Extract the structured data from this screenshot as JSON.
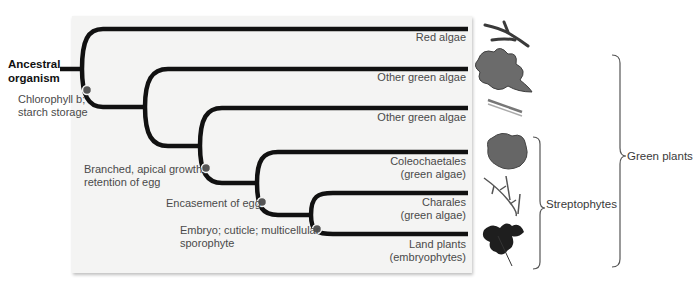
{
  "diagram": {
    "type": "phylogenetic-tree",
    "root_label": [
      "Ancestral",
      "organism"
    ],
    "taxa": [
      {
        "label": [
          "Red algae"
        ],
        "icon": "red-alga-icon"
      },
      {
        "label": [
          "Other green algae"
        ],
        "icon": "green-alga-thallus-icon"
      },
      {
        "label": [
          "Other green algae"
        ],
        "icon": "filamentous-alga-icon"
      },
      {
        "label": [
          "Coleochaetales",
          "(green algae)"
        ],
        "icon": "coleochaete-disk-icon"
      },
      {
        "label": [
          "Charales",
          "(green algae)"
        ],
        "icon": "chara-stonewort-icon"
      },
      {
        "label": [
          "Land plants",
          "(embryophytes)"
        ],
        "icon": "fern-frond-icon"
      }
    ],
    "synapomorphies": [
      {
        "label": [
          "Chlorophyll b;",
          "starch storage"
        ]
      },
      {
        "label": [
          "Branched, apical growth;",
          "retention of egg"
        ]
      },
      {
        "label": [
          "Encasement of egg"
        ]
      },
      {
        "label": [
          "Embryo; cuticle; multicellular",
          "sporophyte"
        ]
      }
    ],
    "brackets": [
      {
        "label": "Streptophytes",
        "spans": [
          "Coleochaetales",
          "Charales",
          "Land plants"
        ]
      },
      {
        "label": "Green plants",
        "spans": [
          "Other green algae",
          "Other green algae",
          "Coleochaetales",
          "Charales",
          "Land plants"
        ]
      }
    ],
    "colors": {
      "branch": "#111111",
      "node_marker": "#555555",
      "panel": "#f4f4f3",
      "text": "#4a4a4a"
    }
  }
}
